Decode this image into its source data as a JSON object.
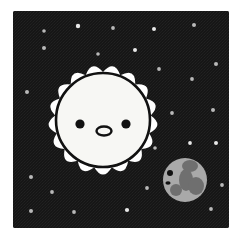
{
  "illustration": {
    "title": "Sun and moon in a starry night sky",
    "caption": "Cute cartoon sun with a face beside a gray moon with a face on a black starfield",
    "style": "flat cartoon sticker illustration"
  },
  "canvas": {
    "width": 242,
    "height": 240,
    "outer_background": "#ffffff",
    "margin_left": 13,
    "margin_top": 11,
    "margin_right": 13,
    "margin_bottom": 12
  },
  "sky": {
    "name": "night-sky-panel",
    "x": 13,
    "y": 11,
    "width": 216,
    "height": 217,
    "fill": "#161616",
    "noise_fill": "#2a2a2a",
    "corner_radius": 2
  },
  "sun": {
    "name": "sun",
    "center_x": 103,
    "center_y": 120,
    "disc_radius": 47,
    "disc_fill": "#f7f7f4",
    "disc_stroke": "#111111",
    "disc_stroke_width": 2.6,
    "corona_fill": "#ffffff",
    "corona_outer_radius": 62,
    "corona_inner_radius": 48,
    "spike_count": 17,
    "face": {
      "eye_fill": "#111111",
      "eye_radius": 4.6,
      "eye_left_x": 80,
      "eye_left_y": 124,
      "eye_right_x": 126,
      "eye_right_y": 124,
      "mouth_center_x": 104,
      "mouth_center_y": 131,
      "mouth_rx": 7.5,
      "mouth_ry": 4.5,
      "mouth_fill": "#f7f7f4",
      "mouth_stroke": "#111111",
      "mouth_stroke_width": 2.4
    }
  },
  "moon": {
    "name": "moon",
    "center_x": 185,
    "center_y": 180,
    "radius": 22,
    "base_fill": "#a9a9a9",
    "crater_fill": "#6f6f6f",
    "highlight_fill": "#bdbdbd",
    "face": {
      "eye_fill": "#111111",
      "eye_x": 170,
      "eye_y": 173,
      "eye_radius": 3.0,
      "mouth_x": 168,
      "mouth_y": 183,
      "mouth_rx": 2.6,
      "mouth_ry": 1.8,
      "mouth_fill": "#111111"
    },
    "patches": [
      {
        "name": "patch-upper-center",
        "cx": 190,
        "cy": 166,
        "rx": 8,
        "ry": 6
      },
      {
        "name": "patch-center-band",
        "cx": 186,
        "cy": 180,
        "rx": 7,
        "ry": 11
      },
      {
        "name": "patch-right-lobe",
        "cx": 196,
        "cy": 186,
        "rx": 8,
        "ry": 9
      },
      {
        "name": "patch-lower-left",
        "cx": 176,
        "cy": 190,
        "rx": 6,
        "ry": 6
      }
    ]
  },
  "stars": {
    "name": "starfield",
    "default_fill": "#b9b9b9",
    "bright_fill": "#e8e8e8",
    "count": 25,
    "points": [
      {
        "x": 44,
        "y": 31,
        "r": 1.8,
        "bright": false
      },
      {
        "x": 78,
        "y": 26,
        "r": 2.2,
        "bright": true
      },
      {
        "x": 113,
        "y": 28,
        "r": 1.9,
        "bright": false
      },
      {
        "x": 154,
        "y": 29,
        "r": 2.0,
        "bright": true
      },
      {
        "x": 194,
        "y": 25,
        "r": 2.0,
        "bright": false
      },
      {
        "x": 44,
        "y": 48,
        "r": 2.0,
        "bright": false
      },
      {
        "x": 98,
        "y": 54,
        "r": 1.8,
        "bright": false
      },
      {
        "x": 135,
        "y": 50,
        "r": 2.0,
        "bright": true
      },
      {
        "x": 216,
        "y": 64,
        "r": 2.0,
        "bright": false
      },
      {
        "x": 159,
        "y": 69,
        "r": 1.9,
        "bright": false
      },
      {
        "x": 192,
        "y": 79,
        "r": 1.9,
        "bright": false
      },
      {
        "x": 27,
        "y": 92,
        "r": 2.0,
        "bright": false
      },
      {
        "x": 213,
        "y": 110,
        "r": 2.0,
        "bright": false
      },
      {
        "x": 172,
        "y": 113,
        "r": 1.9,
        "bright": false
      },
      {
        "x": 216,
        "y": 143,
        "r": 2.0,
        "bright": true
      },
      {
        "x": 190,
        "y": 143,
        "r": 1.9,
        "bright": true
      },
      {
        "x": 155,
        "y": 148,
        "r": 1.8,
        "bright": false
      },
      {
        "x": 31,
        "y": 177,
        "r": 2.0,
        "bright": false
      },
      {
        "x": 52,
        "y": 192,
        "r": 1.9,
        "bright": false
      },
      {
        "x": 147,
        "y": 188,
        "r": 1.9,
        "bright": false
      },
      {
        "x": 222,
        "y": 185,
        "r": 1.9,
        "bright": false
      },
      {
        "x": 31,
        "y": 211,
        "r": 2.0,
        "bright": false
      },
      {
        "x": 74,
        "y": 212,
        "r": 1.9,
        "bright": false
      },
      {
        "x": 127,
        "y": 210,
        "r": 2.1,
        "bright": true
      },
      {
        "x": 211,
        "y": 209,
        "r": 1.9,
        "bright": false
      }
    ]
  }
}
